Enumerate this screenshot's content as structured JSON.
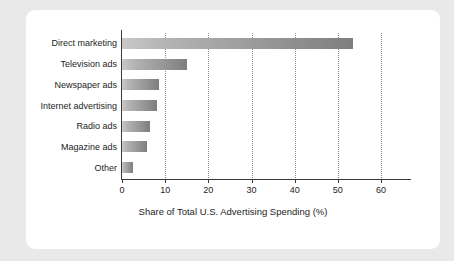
{
  "chart_data": {
    "type": "bar",
    "orientation": "horizontal",
    "title": "",
    "xlabel": "Share of Total U.S. Advertising Spending (%)",
    "ylabel": "",
    "categories": [
      "Direct marketing",
      "Television ads",
      "Newspaper ads",
      "Internet advertising",
      "Radio ads",
      "Magazine ads",
      "Other"
    ],
    "values": [
      53.5,
      15.0,
      8.5,
      8.2,
      6.5,
      5.8,
      2.5
    ],
    "xlim": [
      0,
      69
    ],
    "xticks": [
      0,
      10,
      20,
      30,
      40,
      50,
      60
    ],
    "xtick_labels": [
      "0",
      "10",
      "20",
      "30",
      "40",
      "50",
      "60"
    ],
    "gridlines": [
      10,
      20,
      30,
      40,
      50,
      60
    ],
    "grid": true,
    "grid_style": "dotted",
    "legend": "none",
    "bar_color_start": "#c9c9c9",
    "bar_color_end": "#7e7e7e",
    "axis_color": "#3a3a3a",
    "grid_color": "#8e8e8e",
    "card_background": "#ffffff",
    "page_background": "#e9e9e9"
  }
}
